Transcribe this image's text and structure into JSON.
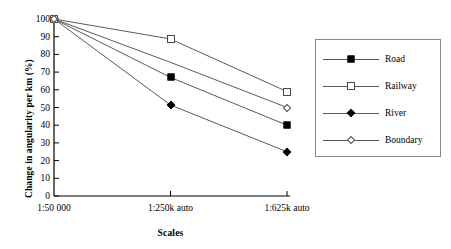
{
  "chart_data": {
    "type": "line",
    "title": "",
    "xlabel": "Scales",
    "ylabel": "Change in angularity per km (%)",
    "categories": [
      "1:50 000",
      "1:250k auto",
      "1:625k auto"
    ],
    "ylim": [
      0,
      100
    ],
    "ytick_step": 10,
    "yticks": [
      "100",
      "90",
      "80",
      "70",
      "60",
      "50",
      "40",
      "30",
      "20",
      "10",
      "0"
    ],
    "grid": false,
    "legend_position": "right",
    "series": [
      {
        "name": "Road",
        "marker": "filled-square",
        "values": [
          100,
          67,
          40
        ],
        "markers_shown": [
          true,
          true,
          true
        ]
      },
      {
        "name": "Railway",
        "marker": "open-square",
        "values": [
          100,
          88.7,
          59
        ],
        "markers_shown": [
          true,
          true,
          true
        ]
      },
      {
        "name": "River",
        "marker": "filled-diamond",
        "values": [
          100,
          51.4,
          25
        ],
        "markers_shown": [
          true,
          true,
          true
        ]
      },
      {
        "name": "Boundary",
        "marker": "open-diamond",
        "values": [
          100,
          75.5,
          50
        ],
        "markers_shown": [
          true,
          false,
          true
        ]
      }
    ]
  },
  "legend": {
    "items": [
      {
        "label": "Road"
      },
      {
        "label": "Railway"
      },
      {
        "label": "River"
      },
      {
        "label": "Boundary"
      }
    ]
  },
  "colors": {
    "axis": "#000000",
    "line": "#5a5a5a",
    "marker_fill": "#000000",
    "marker_open": "#ffffff",
    "legend_border": "#8a8a8a",
    "background": "#ffffff"
  }
}
